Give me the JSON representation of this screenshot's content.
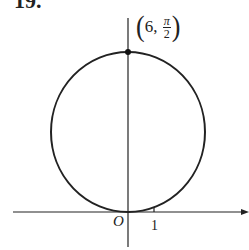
{
  "problem": {
    "number": "19."
  },
  "point_label": {
    "r": "6",
    "comma": ",",
    "theta_numerator": "π",
    "theta_denominator": "2",
    "open": "(",
    "close": ")"
  },
  "axes": {
    "origin_label": "O",
    "x_tick_label": "1"
  },
  "figure": {
    "curve": "circle",
    "center_px": [
      128,
      132
    ],
    "radius_px": 79,
    "marked_point": "(6, π/2)"
  },
  "colors": {
    "stroke": "#222222",
    "background": "#ffffff"
  }
}
